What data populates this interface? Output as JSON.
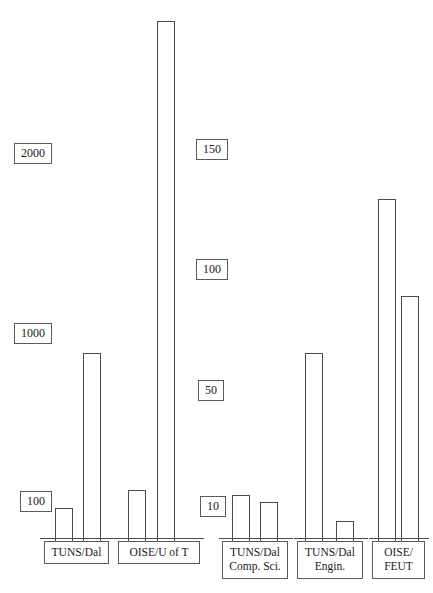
{
  "chart_data": {
    "type": "bar",
    "title": "",
    "xlabel": "",
    "ylabel": "",
    "grid": false,
    "legend_position": "none",
    "orientation": "vertical",
    "bar_style": "outlined-white",
    "categories": [
      "TUNS/Dal",
      "OISE/U of T",
      "TUNS/Dal Comp. Sci.",
      "TUNS/Dal Engin.",
      "OISE/FEUT"
    ],
    "series": [
      {
        "name": "Series 1",
        "values": [
          150,
          330,
          48,
          132,
          1480
        ]
      },
      {
        "name": "Series 2",
        "values": [
          1030,
          2180,
          42,
          20,
          980
        ]
      }
    ],
    "axes": [
      {
        "name": "left-axis",
        "position": "left",
        "ticks": [
          100,
          1000,
          2000
        ],
        "range": [
          0,
          2400
        ]
      },
      {
        "name": "middle-axis",
        "position": "middle",
        "ticks": [
          10,
          50,
          100,
          150
        ],
        "range": [
          0,
          170
        ]
      }
    ]
  },
  "title": {
    "text": ""
  },
  "left_axis": {
    "name": "left-axis",
    "ticks": [
      {
        "label": "2000",
        "x": 14,
        "y": 143
      },
      {
        "label": "1000",
        "x": 14,
        "y": 323
      },
      {
        "label": "100",
        "x": 20,
        "y": 491
      }
    ]
  },
  "middle_axis": {
    "name": "middle-axis",
    "ticks": [
      {
        "label": "150",
        "x": 196,
        "y": 139
      },
      {
        "label": "100",
        "x": 196,
        "y": 259
      },
      {
        "label": "50",
        "x": 198,
        "y": 380
      },
      {
        "label": "10",
        "x": 200,
        "y": 496
      }
    ]
  },
  "groups": [
    {
      "name": "group-tuns-dal",
      "label_line1": "TUNS/Dal",
      "label_line2": "",
      "label_x": 44,
      "label_y": 541,
      "label_w": 65,
      "baseline_x": 40,
      "baseline_w": 76,
      "baseline_y": 538,
      "bars": [
        {
          "name": "bar-tuns-dal-1",
          "x": 55,
          "w": 18,
          "top": 508,
          "value": 150
        },
        {
          "name": "bar-tuns-dal-2",
          "x": 83,
          "w": 18,
          "top": 353,
          "value": 1030
        }
      ]
    },
    {
      "name": "group-oise-u-of-t",
      "label_line1": "OISE/U of T",
      "label_line2": "",
      "label_x": 118,
      "label_y": 541,
      "label_w": 82,
      "baseline_x": 116,
      "baseline_w": 88,
      "baseline_y": 538,
      "bars": [
        {
          "name": "bar-oise-uoft-1",
          "x": 128,
          "w": 18,
          "top": 490,
          "value": 330
        },
        {
          "name": "bar-oise-uoft-2",
          "x": 157,
          "w": 18,
          "top": 21,
          "value": 2180
        }
      ]
    },
    {
      "name": "group-tuns-dal-comp-sci",
      "label_line1": "TUNS/Dal",
      "label_line2": "Comp. Sci.",
      "label_x": 222,
      "label_y": 541,
      "label_w": 66,
      "baseline_x": 219,
      "baseline_w": 74,
      "baseline_y": 538,
      "bars": [
        {
          "name": "bar-tuns-dal-cs-1",
          "x": 232,
          "w": 18,
          "top": 495,
          "value": 48
        },
        {
          "name": "bar-tuns-dal-cs-2",
          "x": 260,
          "w": 18,
          "top": 502,
          "value": 42
        }
      ]
    },
    {
      "name": "group-tuns-dal-engin",
      "label_line1": "TUNS/Dal",
      "label_line2": "Engin.",
      "label_x": 297,
      "label_y": 541,
      "label_w": 66,
      "baseline_x": 294,
      "baseline_w": 74,
      "baseline_y": 538,
      "bars": [
        {
          "name": "bar-tuns-dal-eng-1",
          "x": 305,
          "w": 18,
          "top": 353,
          "value": 132
        },
        {
          "name": "bar-tuns-dal-eng-2",
          "x": 336,
          "w": 18,
          "top": 521,
          "value": 20
        }
      ]
    },
    {
      "name": "group-oise-feut",
      "label_line1": "OISE/",
      "label_line2": "FEUT",
      "label_x": 372,
      "label_y": 541,
      "label_w": 53,
      "baseline_x": 369,
      "baseline_w": 60,
      "baseline_y": 538,
      "bars": [
        {
          "name": "bar-oise-feut-1",
          "x": 378,
          "w": 18,
          "top": 199,
          "value": 1480
        },
        {
          "name": "bar-oise-feut-2",
          "x": 401,
          "w": 18,
          "top": 296,
          "value": 980
        }
      ]
    }
  ],
  "colors": {
    "bar_stroke": "#4a4a4a",
    "bar_fill": "#ffffff",
    "box_stroke": "#5a5a5a",
    "text": "#1a1a1a",
    "background": "#ffffff"
  }
}
